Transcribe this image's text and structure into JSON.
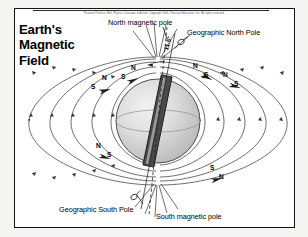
{
  "figure": {
    "copyright": "Pearson Prentice Hall, Physics Concepts in Action, Copyright 2006, Pearson Education, Inc. All rights reserved.",
    "title_lines": [
      "Earth's",
      "Magnetic",
      "Field"
    ],
    "labels": {
      "north_magnetic_pole": "North magnetic pole",
      "geographic_north_pole": "Geographic North Pole",
      "geographic_south_pole": "Geographic South Pole",
      "south_magnetic_pole": "South magnetic pole",
      "tilt_angle": "11.5°"
    },
    "compasses": [
      {
        "id": "compass-upper-left",
        "north": "N",
        "south": "S"
      },
      {
        "id": "compass-upper-mid-left",
        "north": "N",
        "south": "S"
      },
      {
        "id": "compass-upper-right",
        "north": "N",
        "south": "S"
      },
      {
        "id": "compass-mid-right",
        "north": "N",
        "south": "S"
      },
      {
        "id": "compass-lower-left",
        "north": "N",
        "south": "S"
      },
      {
        "id": "compass-lower-right",
        "north": "N",
        "south": "S"
      }
    ],
    "colors": {
      "panel_border": "#141414",
      "page_background": "#f4f4f2",
      "panel_background": "#ffffff",
      "field_line": "#4a4a4a",
      "globe_fill": "#d8d8d8",
      "magnet_bar": "#3a3a3a",
      "text": "#000000"
    }
  }
}
